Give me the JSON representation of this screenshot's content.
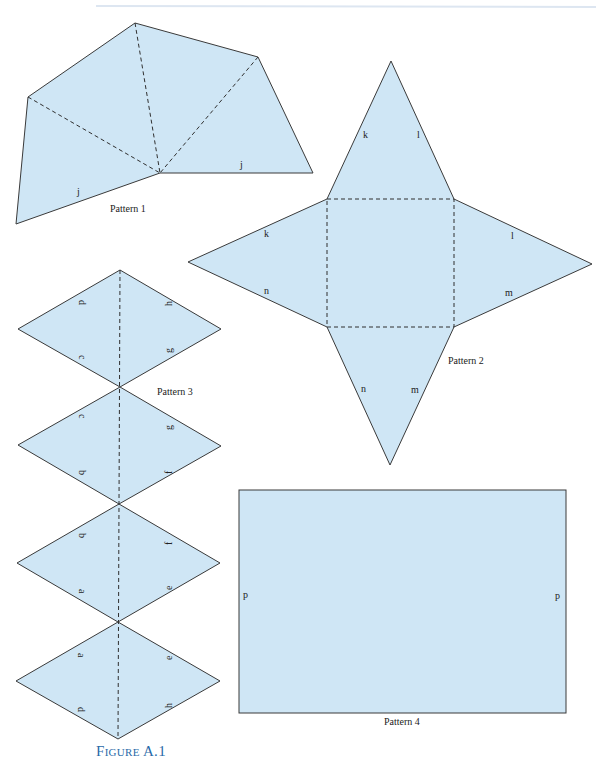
{
  "figure": {
    "caption": "Figure A.1",
    "colors": {
      "fill": "#cfe6f5",
      "edge": "#3a3a3a",
      "caption": "#2a6aa8"
    }
  },
  "patterns": [
    {
      "name": "Pattern 1",
      "edge_labels": [
        "j",
        "j"
      ]
    },
    {
      "name": "Pattern 2",
      "edge_labels": [
        "k",
        "l",
        "k",
        "l",
        "n",
        "m",
        "n",
        "m"
      ]
    },
    {
      "name": "Pattern 3",
      "rhombi": [
        {
          "left_labels": [
            "d",
            "c"
          ],
          "right_labels": [
            "h",
            "g"
          ]
        },
        {
          "left_labels": [
            "c",
            "b"
          ],
          "right_labels": [
            "g",
            "f"
          ]
        },
        {
          "left_labels": [
            "b",
            "a"
          ],
          "right_labels": [
            "f",
            "e"
          ]
        },
        {
          "left_labels": [
            "a",
            "d"
          ],
          "right_labels": [
            "e",
            "h"
          ]
        }
      ]
    },
    {
      "name": "Pattern 4",
      "edge_labels": [
        "p",
        "p"
      ]
    }
  ]
}
